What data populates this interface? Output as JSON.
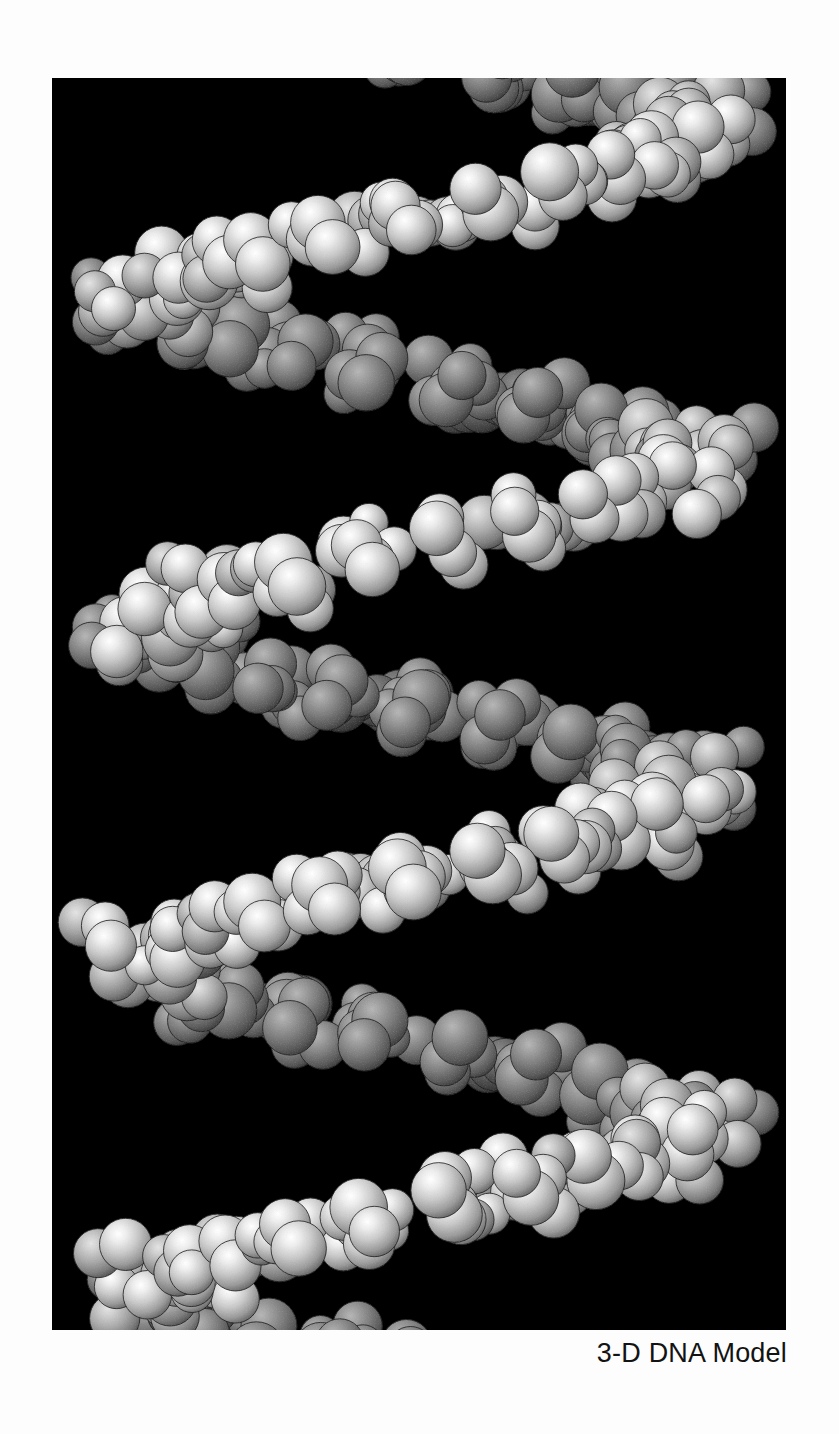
{
  "page": {
    "background_color": "#fdfdfd",
    "width": 839,
    "height": 1434
  },
  "figure": {
    "plate": {
      "background_color": "#000000",
      "x": 52,
      "y": 78,
      "width": 734,
      "height": 1252,
      "subject": "dna-double-helix-space-filling-model",
      "rendering_style": "CPK space-filling spheres, grayscale, single light source upper-left",
      "alt_text": "Grayscale space-filling molecular model of a DNA double helix viewed from the side, showing two sugar-phosphate backbones spiralling around horizontal base-pair rungs"
    },
    "caption": "3-D DNA Model",
    "caption_color": "#131313",
    "caption_align": "right"
  },
  "model_data": {
    "type": "molecular-render",
    "molecule": "B-form DNA double helix",
    "representation": "space-filling (CPK)",
    "palette": {
      "backbone_light": "#e8e8e8",
      "backbone_mid": "#b4b4b4",
      "base_dark": "#6e6e6e",
      "base_darkest": "#4a4a4a",
      "shadow": "#1c1c1c",
      "background": "#000000"
    },
    "helix": {
      "axis": "vertical",
      "turns_visible": 3,
      "rise_per_turn_px": 360,
      "radius_px": 250,
      "rungs": 22,
      "sphere_radius_px": 26,
      "strand_phase_offset_deg": 150
    }
  }
}
